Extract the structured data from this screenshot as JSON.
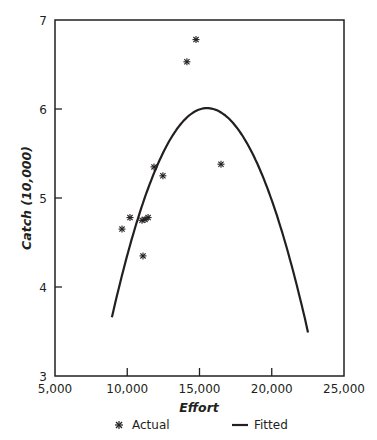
{
  "chart_data": {
    "type": "scatter",
    "title": "",
    "xlabel": "Effort",
    "ylabel": "Catch (10,000)",
    "xlim": [
      5000,
      25000
    ],
    "ylim": [
      3,
      7
    ],
    "x_ticks": [
      5000,
      10000,
      15000,
      20000,
      25000
    ],
    "x_tick_labels": [
      "5,000",
      "10,000",
      "15,000",
      "20,000",
      "25,000"
    ],
    "y_ticks": [
      3,
      4,
      5,
      6,
      7
    ],
    "y_tick_labels": [
      "3",
      "4",
      "5",
      "6",
      "7"
    ],
    "grid": false,
    "legend_position": "bottom",
    "series": [
      {
        "name": "Actual",
        "type": "scatter",
        "marker": "asterisk",
        "x": [
          9640,
          10190,
          11020,
          11230,
          11440,
          11090,
          11850,
          12470,
          14130,
          14760,
          16490
        ],
        "y": [
          4.65,
          4.78,
          4.75,
          4.76,
          4.78,
          4.35,
          5.35,
          5.25,
          6.53,
          6.78,
          5.38
        ]
      },
      {
        "name": "Fitted",
        "type": "line",
        "shape": "quadratic",
        "x_range": [
          8940,
          22510
        ],
        "vertex": [
          15520,
          6.01
        ],
        "endpoints_y": [
          3.66,
          3.49
        ]
      }
    ]
  },
  "legend": {
    "actual_label": "Actual",
    "fitted_label": "Fitted"
  },
  "colors": {
    "ink": "#231f20",
    "background": "#ffffff"
  }
}
